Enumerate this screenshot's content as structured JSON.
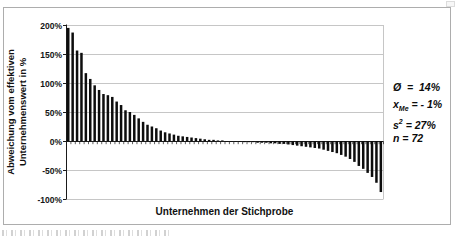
{
  "figure": {
    "y_axis_title_line1": "Abweichung vom effektiven",
    "y_axis_title_line2": "Unternehmenswert in %",
    "x_axis_title": "Unternehmen der Stichprobe",
    "annotation_lines": [
      {
        "lhs": "Ø",
        "sub": "",
        "sup": "",
        "rhs": "  =  14%"
      },
      {
        "lhs": "x",
        "sub": "Me",
        "sup": "",
        "rhs": " = - 1%"
      },
      {
        "lhs": "s",
        "sub": "",
        "sup": "2",
        "rhs": " = 27%"
      },
      {
        "lhs": "n",
        "sub": "",
        "sup": "",
        "rhs": " = 72"
      }
    ]
  },
  "chart_data": {
    "type": "bar",
    "title": "",
    "xlabel": "Unternehmen der Stichprobe",
    "ylabel": "Abweichung vom effektiven Unternehmenswert in %",
    "ylim": [
      -100,
      200
    ],
    "grid": true,
    "legend": false,
    "n": 72,
    "yticks": [
      {
        "value": 200,
        "label": "200%"
      },
      {
        "value": 150,
        "label": "150%"
      },
      {
        "value": 100,
        "label": "100%"
      },
      {
        "value": 50,
        "label": "50%"
      },
      {
        "value": 0,
        "label": "0%"
      },
      {
        "value": -50,
        "label": "-50%"
      },
      {
        "value": -100,
        "label": "-100%"
      }
    ],
    "values": [
      195,
      187,
      156,
      152,
      117,
      107,
      96,
      88,
      81,
      79,
      76,
      68,
      62,
      53,
      50,
      45,
      39,
      33,
      28,
      25,
      22,
      18,
      15,
      13,
      11,
      9,
      8,
      7,
      6,
      5,
      4,
      3,
      2,
      2,
      1,
      1,
      0,
      -1,
      -1,
      -1,
      -2,
      -2,
      -2,
      -3,
      -3,
      -3,
      -4,
      -4,
      -5,
      -5,
      -6,
      -7,
      -8,
      -9,
      -10,
      -11,
      -12,
      -13,
      -15,
      -17,
      -19,
      -21,
      -24,
      -27,
      -31,
      -36,
      -43,
      -48,
      -55,
      -62,
      -72,
      -88
    ],
    "annotations": [
      "Ø = 14%",
      "xMe = - 1%",
      "s² = 27%",
      "n = 72"
    ],
    "colors": {
      "bar": "#0d0d0d",
      "axis": "#1a1a1a",
      "grid": "#c6c6c6",
      "figure_border": "#adadad",
      "text": "#111111"
    },
    "layout": {
      "plot_left": 66,
      "plot_right": 383,
      "plot_top": 25,
      "plot_bottom": 199,
      "zero_y": 141
    }
  }
}
